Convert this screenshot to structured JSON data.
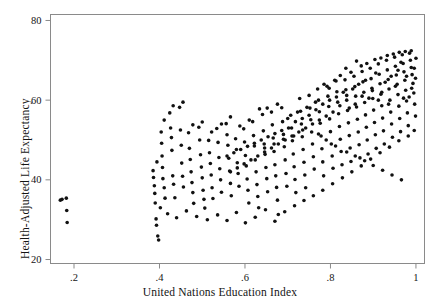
{
  "chart_data": {
    "type": "scatter",
    "title": "",
    "xlabel": "United Nations Education Index",
    "ylabel": "Health-Adjusted Life Expectancy",
    "xlim": [
      0.145,
      1.02
    ],
    "ylim": [
      19.0,
      81.5
    ],
    "xticks": [
      0.2,
      0.4,
      0.6,
      0.8,
      1.0
    ],
    "xticklabels": [
      ".2",
      ".4",
      ".6",
      ".8",
      "1"
    ],
    "yticks": [
      20,
      40,
      60,
      80
    ],
    "yticklabels": [
      "20",
      "40",
      "60",
      "80"
    ],
    "grid": false,
    "legend": null,
    "marker": {
      "shape": "circle",
      "size_px": 3.6,
      "color": "#111111"
    },
    "frame": {
      "top": true,
      "right": true,
      "bottom": true,
      "left": true,
      "color": "#8a8a8a"
    },
    "points": [
      [
        0.168,
        34.9
      ],
      [
        0.172,
        35.1
      ],
      [
        0.182,
        35.4
      ],
      [
        0.183,
        32.3
      ],
      [
        0.184,
        29.3
      ],
      [
        0.385,
        42.3
      ],
      [
        0.386,
        40.6
      ],
      [
        0.388,
        38.5
      ],
      [
        0.389,
        36.6
      ],
      [
        0.39,
        34.2
      ],
      [
        0.392,
        30.2
      ],
      [
        0.393,
        28.6
      ],
      [
        0.396,
        25.9
      ],
      [
        0.398,
        24.9
      ],
      [
        0.404,
        52.0
      ],
      [
        0.405,
        49.2
      ],
      [
        0.406,
        46.0
      ],
      [
        0.407,
        43.1
      ],
      [
        0.408,
        40.3
      ],
      [
        0.411,
        38.0
      ],
      [
        0.413,
        35.4
      ],
      [
        0.424,
        56.8
      ],
      [
        0.426,
        53.0
      ],
      [
        0.428,
        50.6
      ],
      [
        0.429,
        47.4
      ],
      [
        0.431,
        41.0
      ],
      [
        0.433,
        38.9
      ],
      [
        0.436,
        35.5
      ],
      [
        0.447,
        58.2
      ],
      [
        0.449,
        52.5
      ],
      [
        0.451,
        48.7
      ],
      [
        0.452,
        44.2
      ],
      [
        0.454,
        40.9
      ],
      [
        0.456,
        38.2
      ],
      [
        0.468,
        51.8
      ],
      [
        0.47,
        47.9
      ],
      [
        0.472,
        45.1
      ],
      [
        0.474,
        42.0
      ],
      [
        0.476,
        39.3
      ],
      [
        0.478,
        36.8
      ],
      [
        0.48,
        34.1
      ],
      [
        0.492,
        53.2
      ],
      [
        0.494,
        50.0
      ],
      [
        0.496,
        46.3
      ],
      [
        0.498,
        43.2
      ],
      [
        0.5,
        40.5
      ],
      [
        0.502,
        37.4
      ],
      [
        0.504,
        35.1
      ],
      [
        0.506,
        32.9
      ],
      [
        0.515,
        49.9
      ],
      [
        0.517,
        46.8
      ],
      [
        0.519,
        44.1
      ],
      [
        0.521,
        41.2
      ],
      [
        0.523,
        38.0
      ],
      [
        0.525,
        35.3
      ],
      [
        0.534,
        52.9
      ],
      [
        0.537,
        49.4
      ],
      [
        0.539,
        45.6
      ],
      [
        0.541,
        42.8
      ],
      [
        0.543,
        40.0
      ],
      [
        0.545,
        36.9
      ],
      [
        0.556,
        54.1
      ],
      [
        0.558,
        51.3
      ],
      [
        0.56,
        48.7
      ],
      [
        0.562,
        45.4
      ],
      [
        0.564,
        42.2
      ],
      [
        0.566,
        39.1
      ],
      [
        0.568,
        36.0
      ],
      [
        0.578,
        50.3
      ],
      [
        0.58,
        47.6
      ],
      [
        0.582,
        44.3
      ],
      [
        0.584,
        41.6
      ],
      [
        0.586,
        38.4
      ],
      [
        0.597,
        52.8
      ],
      [
        0.599,
        49.5
      ],
      [
        0.601,
        46.1
      ],
      [
        0.603,
        43.5
      ],
      [
        0.605,
        40.2
      ],
      [
        0.607,
        37.4
      ],
      [
        0.609,
        34.2
      ],
      [
        0.618,
        54.6
      ],
      [
        0.62,
        51.1
      ],
      [
        0.622,
        48.5
      ],
      [
        0.624,
        45.0
      ],
      [
        0.626,
        42.0
      ],
      [
        0.628,
        38.8
      ],
      [
        0.63,
        35.8
      ],
      [
        0.632,
        33.0
      ],
      [
        0.641,
        56.4
      ],
      [
        0.643,
        52.3
      ],
      [
        0.645,
        49.0
      ],
      [
        0.647,
        46.4
      ],
      [
        0.649,
        43.1
      ],
      [
        0.651,
        40.3
      ],
      [
        0.653,
        37.0
      ],
      [
        0.662,
        57.0
      ],
      [
        0.664,
        53.8
      ],
      [
        0.666,
        50.5
      ],
      [
        0.668,
        47.1
      ],
      [
        0.67,
        43.8
      ],
      [
        0.672,
        41.0
      ],
      [
        0.674,
        38.1
      ],
      [
        0.676,
        34.9
      ],
      [
        0.678,
        31.3
      ],
      [
        0.686,
        58.1
      ],
      [
        0.688,
        54.6
      ],
      [
        0.69,
        51.4
      ],
      [
        0.692,
        48.3
      ],
      [
        0.694,
        45.0
      ],
      [
        0.696,
        41.6
      ],
      [
        0.698,
        38.4
      ],
      [
        0.707,
        56.2
      ],
      [
        0.709,
        53.0
      ],
      [
        0.711,
        49.8
      ],
      [
        0.713,
        46.5
      ],
      [
        0.715,
        43.3
      ],
      [
        0.717,
        40.1
      ],
      [
        0.719,
        36.8
      ],
      [
        0.728,
        60.4
      ],
      [
        0.73,
        57.2
      ],
      [
        0.732,
        54.0
      ],
      [
        0.734,
        50.8
      ],
      [
        0.736,
        47.6
      ],
      [
        0.738,
        44.4
      ],
      [
        0.74,
        41.2
      ],
      [
        0.742,
        38.0
      ],
      [
        0.75,
        61.2
      ],
      [
        0.752,
        58.0
      ],
      [
        0.754,
        55.1
      ],
      [
        0.756,
        52.0
      ],
      [
        0.758,
        49.0
      ],
      [
        0.76,
        45.8
      ],
      [
        0.762,
        42.7
      ],
      [
        0.77,
        62.8
      ],
      [
        0.772,
        60.0
      ],
      [
        0.774,
        57.1
      ],
      [
        0.776,
        54.2
      ],
      [
        0.778,
        51.0
      ],
      [
        0.78,
        47.8
      ],
      [
        0.782,
        44.5
      ],
      [
        0.784,
        41.0
      ],
      [
        0.792,
        63.5
      ],
      [
        0.794,
        61.0
      ],
      [
        0.796,
        58.4
      ],
      [
        0.798,
        55.3
      ],
      [
        0.8,
        52.1
      ],
      [
        0.802,
        49.0
      ],
      [
        0.804,
        46.0
      ],
      [
        0.806,
        42.9
      ],
      [
        0.813,
        64.8
      ],
      [
        0.815,
        62.1
      ],
      [
        0.817,
        59.5
      ],
      [
        0.819,
        56.6
      ],
      [
        0.821,
        53.4
      ],
      [
        0.823,
        50.2
      ],
      [
        0.825,
        47.1
      ],
      [
        0.827,
        43.8
      ],
      [
        0.834,
        65.1
      ],
      [
        0.836,
        62.6
      ],
      [
        0.838,
        60.0
      ],
      [
        0.84,
        57.4
      ],
      [
        0.842,
        54.3
      ],
      [
        0.844,
        51.1
      ],
      [
        0.846,
        48.0
      ],
      [
        0.848,
        44.6
      ],
      [
        0.855,
        66.0
      ],
      [
        0.857,
        63.4
      ],
      [
        0.859,
        61.0
      ],
      [
        0.861,
        58.3
      ],
      [
        0.863,
        55.2
      ],
      [
        0.865,
        52.0
      ],
      [
        0.867,
        48.8
      ],
      [
        0.869,
        45.5
      ],
      [
        0.874,
        67.2
      ],
      [
        0.876,
        64.6
      ],
      [
        0.878,
        62.0
      ],
      [
        0.88,
        59.4
      ],
      [
        0.882,
        56.3
      ],
      [
        0.884,
        53.2
      ],
      [
        0.886,
        50.0
      ],
      [
        0.888,
        46.5
      ],
      [
        0.893,
        68.0
      ],
      [
        0.895,
        65.4
      ],
      [
        0.897,
        63.0
      ],
      [
        0.899,
        60.4
      ],
      [
        0.901,
        57.5
      ],
      [
        0.903,
        54.4
      ],
      [
        0.905,
        51.3
      ],
      [
        0.907,
        47.9
      ],
      [
        0.912,
        69.1
      ],
      [
        0.914,
        66.5
      ],
      [
        0.916,
        64.1
      ],
      [
        0.918,
        61.5
      ],
      [
        0.92,
        58.6
      ],
      [
        0.922,
        55.5
      ],
      [
        0.924,
        52.3
      ],
      [
        0.926,
        49.0
      ],
      [
        0.931,
        70.0
      ],
      [
        0.933,
        67.6
      ],
      [
        0.935,
        65.2
      ],
      [
        0.937,
        62.8
      ],
      [
        0.939,
        60.0
      ],
      [
        0.941,
        57.0
      ],
      [
        0.943,
        54.0
      ],
      [
        0.945,
        50.7
      ],
      [
        0.95,
        70.8
      ],
      [
        0.952,
        68.5
      ],
      [
        0.954,
        66.3
      ],
      [
        0.956,
        64.0
      ],
      [
        0.958,
        61.4
      ],
      [
        0.96,
        58.5
      ],
      [
        0.962,
        55.4
      ],
      [
        0.964,
        52.1
      ],
      [
        0.968,
        71.4
      ],
      [
        0.97,
        69.2
      ],
      [
        0.972,
        67.1
      ],
      [
        0.974,
        65.0
      ],
      [
        0.976,
        62.5
      ],
      [
        0.978,
        59.8
      ],
      [
        0.98,
        56.8
      ],
      [
        0.982,
        53.6
      ],
      [
        0.985,
        71.8
      ],
      [
        0.987,
        70.0
      ],
      [
        0.989,
        68.2
      ],
      [
        0.991,
        66.4
      ],
      [
        0.993,
        64.2
      ],
      [
        0.995,
        61.8
      ],
      [
        0.997,
        59.0
      ],
      [
        0.999,
        56.0
      ],
      [
        0.861,
        69.8
      ],
      [
        0.872,
        68.6
      ],
      [
        0.885,
        69.2
      ],
      [
        0.904,
        70.2
      ],
      [
        0.918,
        70.6
      ],
      [
        0.933,
        71.2
      ],
      [
        0.947,
        71.6
      ],
      [
        0.961,
        72.0
      ],
      [
        0.975,
        72.2
      ],
      [
        0.989,
        72.4
      ],
      [
        0.836,
        68.0
      ],
      [
        0.848,
        67.0
      ],
      [
        0.823,
        66.2
      ],
      [
        0.81,
        65.0
      ],
      [
        0.797,
        63.0
      ],
      [
        0.785,
        64.0
      ],
      [
        0.765,
        59.5
      ],
      [
        0.745,
        58.2
      ],
      [
        0.723,
        57.0
      ],
      [
        0.7,
        55.4
      ],
      [
        0.676,
        59.0
      ],
      [
        0.652,
        58.0
      ],
      [
        0.634,
        57.8
      ],
      [
        0.61,
        55.0
      ],
      [
        0.588,
        53.5
      ],
      [
        0.566,
        55.8
      ],
      [
        0.545,
        54.0
      ],
      [
        0.522,
        52.0
      ],
      [
        0.5,
        54.5
      ],
      [
        0.478,
        53.8
      ],
      [
        0.455,
        59.5
      ],
      [
        0.432,
        58.6
      ],
      [
        0.411,
        55.0
      ],
      [
        0.394,
        44.5
      ],
      [
        0.402,
        33.0
      ],
      [
        0.419,
        31.5
      ],
      [
        0.44,
        30.5
      ],
      [
        0.463,
        32.2
      ],
      [
        0.487,
        30.8
      ],
      [
        0.512,
        30.0
      ],
      [
        0.536,
        31.2
      ],
      [
        0.558,
        29.8
      ],
      [
        0.58,
        31.8
      ],
      [
        0.601,
        29.2
      ],
      [
        0.624,
        30.6
      ],
      [
        0.648,
        32.5
      ],
      [
        0.67,
        29.6
      ],
      [
        0.693,
        32.0
      ],
      [
        0.716,
        33.5
      ],
      [
        0.738,
        34.8
      ],
      [
        0.76,
        36.0
      ],
      [
        0.782,
        37.4
      ],
      [
        0.805,
        39.0
      ],
      [
        0.828,
        40.5
      ],
      [
        0.85,
        42.0
      ],
      [
        0.872,
        43.5
      ],
      [
        0.894,
        45.2
      ],
      [
        0.916,
        46.8
      ],
      [
        0.938,
        48.2
      ],
      [
        0.96,
        49.8
      ],
      [
        0.982,
        51.0
      ],
      [
        0.996,
        52.4
      ],
      [
        0.772,
        51.5
      ],
      [
        0.79,
        50.0
      ],
      [
        0.812,
        48.5
      ],
      [
        0.838,
        47.0
      ],
      [
        0.858,
        46.0
      ],
      [
        0.88,
        44.8
      ],
      [
        0.9,
        43.6
      ],
      [
        0.922,
        42.4
      ],
      [
        0.944,
        41.2
      ],
      [
        0.966,
        40.0
      ],
      [
        0.735,
        52.5
      ],
      [
        0.714,
        51.0
      ],
      [
        0.69,
        50.2
      ],
      [
        0.668,
        49.0
      ],
      [
        0.646,
        48.0
      ],
      [
        0.952,
        63.5
      ],
      [
        0.958,
        67.5
      ],
      [
        0.965,
        69.5
      ],
      [
        0.971,
        60.5
      ],
      [
        0.978,
        66.0
      ],
      [
        0.984,
        60.8
      ],
      [
        0.99,
        63.0
      ],
      [
        0.996,
        68.0
      ],
      [
        1.0,
        70.5
      ],
      [
        0.999,
        65.5
      ],
      [
        0.942,
        66.0
      ],
      [
        0.936,
        59.0
      ],
      [
        0.928,
        64.5
      ],
      [
        0.92,
        62.0
      ],
      [
        0.912,
        60.0
      ],
      [
        0.906,
        66.8
      ],
      [
        0.898,
        62.4
      ],
      [
        0.89,
        60.5
      ],
      [
        0.882,
        65.0
      ],
      [
        0.874,
        61.0
      ],
      [
        0.866,
        64.0
      ],
      [
        0.858,
        59.0
      ],
      [
        0.852,
        62.8
      ],
      [
        0.844,
        58.0
      ],
      [
        0.838,
        61.2
      ],
      [
        0.83,
        62.0
      ],
      [
        0.822,
        58.6
      ],
      [
        0.814,
        60.8
      ],
      [
        0.806,
        57.0
      ],
      [
        0.798,
        60.0
      ],
      [
        0.79,
        56.0
      ],
      [
        0.782,
        59.0
      ],
      [
        0.774,
        55.0
      ],
      [
        0.766,
        57.6
      ],
      [
        0.758,
        54.0
      ],
      [
        0.75,
        56.2
      ],
      [
        0.742,
        53.0
      ],
      [
        0.734,
        55.4
      ],
      [
        0.726,
        52.0
      ],
      [
        0.718,
        54.6
      ],
      [
        0.71,
        51.0
      ],
      [
        0.702,
        53.0
      ],
      [
        0.694,
        50.0
      ],
      [
        0.686,
        52.4
      ],
      [
        0.678,
        49.0
      ],
      [
        0.67,
        51.6
      ],
      [
        0.662,
        48.0
      ],
      [
        0.654,
        50.8
      ],
      [
        0.646,
        47.0
      ],
      [
        0.638,
        50.0
      ],
      [
        0.63,
        46.0
      ],
      [
        0.622,
        49.2
      ],
      [
        0.614,
        45.0
      ],
      [
        0.606,
        48.4
      ],
      [
        0.598,
        44.0
      ],
      [
        0.59,
        47.6
      ],
      [
        0.582,
        43.0
      ],
      [
        0.574,
        46.8
      ],
      [
        0.566,
        42.0
      ],
      [
        0.558,
        46.0
      ]
    ]
  }
}
